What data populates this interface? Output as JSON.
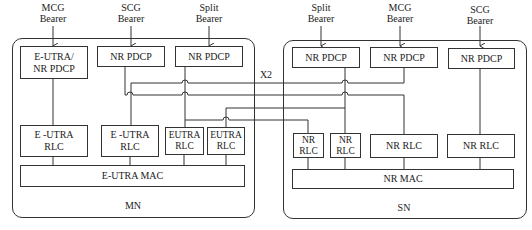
{
  "diagram": {
    "interface_label": "X2",
    "bearer_labels": {
      "mn_mcg": "MCG\nBearer",
      "mn_scg": "SCG\nBearer",
      "mn_split": "Split\nBearer",
      "sn_split": "Split\nBearer",
      "sn_mcg": "MCG\nBearer",
      "sn_scg": "SCG\nBearer"
    },
    "mn": {
      "label": "MN",
      "pdcp": [
        "E-UTRA/\nNR PDCP",
        "NR PDCP",
        "NR PDCP"
      ],
      "rlc": [
        "E -UTRA\nRLC",
        "E -UTRA\nRLC",
        "EUTRA\nRLC",
        "EUTRA\nRLC"
      ],
      "mac": "E-UTRA MAC"
    },
    "sn": {
      "label": "SN",
      "pdcp": [
        "NR  PDCP",
        "NR  PDCP",
        "NR  PDCP"
      ],
      "rlc": [
        "NR\nRLC",
        "NR\nRLC",
        "NR  RLC",
        "NR  RLC"
      ],
      "mac": "NR MAC"
    },
    "colors": {
      "line": "#333333",
      "background": "#ffffff",
      "text": "#222222"
    }
  }
}
